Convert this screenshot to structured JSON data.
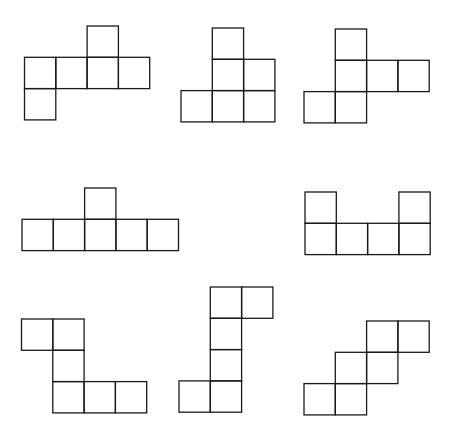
{
  "title": "",
  "nets": [
    {
      "id": "net-1",
      "cells": [
        [
          2,
          0
        ],
        [
          0,
          1
        ],
        [
          1,
          1
        ],
        [
          2,
          1
        ],
        [
          3,
          1
        ],
        [
          0,
          2
        ]
      ]
    },
    {
      "id": "net-2",
      "cells": [
        [
          1,
          0
        ],
        [
          1,
          1
        ],
        [
          2,
          1
        ],
        [
          0,
          2
        ],
        [
          1,
          2
        ],
        [
          2,
          2
        ]
      ]
    },
    {
      "id": "net-3",
      "cells": [
        [
          1,
          0
        ],
        [
          1,
          1
        ],
        [
          2,
          1
        ],
        [
          3,
          1
        ],
        [
          0,
          2
        ],
        [
          1,
          2
        ]
      ]
    },
    {
      "id": "net-4",
      "cells": [
        [
          2,
          0
        ],
        [
          0,
          1
        ],
        [
          1,
          1
        ],
        [
          2,
          1
        ],
        [
          3,
          1
        ],
        [
          4,
          1
        ]
      ]
    },
    {
      "id": "net-5",
      "cells": [
        [
          0,
          0
        ],
        [
          3,
          0
        ],
        [
          0,
          1
        ],
        [
          1,
          1
        ],
        [
          2,
          1
        ],
        [
          3,
          1
        ]
      ]
    },
    {
      "id": "net-6",
      "cells": [
        [
          0,
          0
        ],
        [
          1,
          0
        ],
        [
          1,
          1
        ],
        [
          1,
          2
        ],
        [
          2,
          2
        ],
        [
          3,
          2
        ]
      ]
    },
    {
      "id": "net-7",
      "cells": [
        [
          1,
          0
        ],
        [
          2,
          0
        ],
        [
          1,
          1
        ],
        [
          1,
          2
        ],
        [
          0,
          3
        ],
        [
          1,
          3
        ]
      ]
    },
    {
      "id": "net-8",
      "cells": [
        [
          2,
          0
        ],
        [
          3,
          0
        ],
        [
          1,
          1
        ],
        [
          2,
          1
        ],
        [
          0,
          2
        ],
        [
          1,
          2
        ]
      ]
    }
  ],
  "colors": {
    "stroke": "#1a1a1a",
    "background": "#ffffff"
  }
}
